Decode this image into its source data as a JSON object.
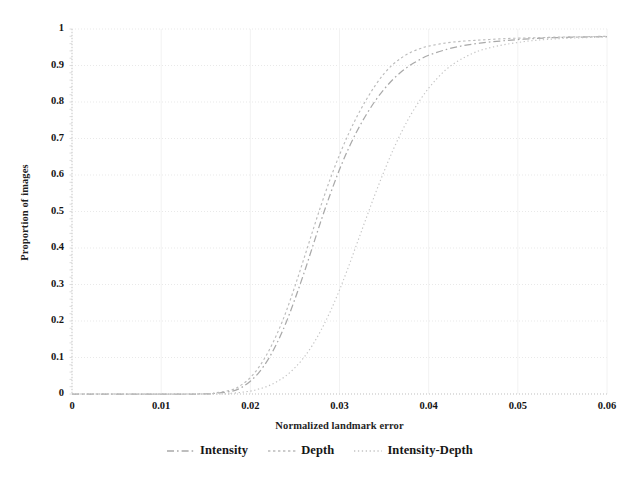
{
  "chart_data": {
    "type": "line",
    "title": "",
    "subtitle": "",
    "xlabel": "Normalized landmark error",
    "ylabel": "Proportion of images",
    "xlim": [
      0,
      0.06
    ],
    "ylim": [
      0,
      1
    ],
    "xticks": [
      "0",
      "0.01",
      "0.02",
      "0.03",
      "0.04",
      "0.05",
      "0.06"
    ],
    "xtick_values": [
      0,
      0.01,
      0.02,
      0.03,
      0.04,
      0.05,
      0.06
    ],
    "yticks": [
      "0",
      "0.1",
      "0.2",
      "0.3",
      "0.4",
      "0.5",
      "0.6",
      "0.7",
      "0.8",
      "0.9",
      "1"
    ],
    "ytick_values": [
      0,
      0.1,
      0.2,
      0.3,
      0.4,
      0.5,
      0.6,
      0.7,
      0.8,
      0.9,
      1
    ],
    "grid": "horizontal-dotted",
    "legend_position": "below",
    "line_color": "#b9b9b9",
    "grid_color": "#e9e9e9",
    "axis_color": "#c9c9c9",
    "series": [
      {
        "name": "Intensity",
        "dash": "dash-dot",
        "color": "#a9a9a9",
        "x": [
          0.0,
          0.014,
          0.016,
          0.018,
          0.019,
          0.02,
          0.021,
          0.022,
          0.023,
          0.024,
          0.025,
          0.026,
          0.027,
          0.028,
          0.029,
          0.03,
          0.031,
          0.032,
          0.033,
          0.034,
          0.035,
          0.036,
          0.037,
          0.038,
          0.039,
          0.04,
          0.042,
          0.044,
          0.046,
          0.048,
          0.05,
          0.052,
          0.055,
          0.06
        ],
        "y": [
          0.0,
          0.0,
          0.002,
          0.008,
          0.018,
          0.035,
          0.06,
          0.095,
          0.14,
          0.195,
          0.26,
          0.33,
          0.405,
          0.48,
          0.55,
          0.615,
          0.672,
          0.722,
          0.765,
          0.803,
          0.835,
          0.862,
          0.884,
          0.902,
          0.916,
          0.928,
          0.944,
          0.955,
          0.962,
          0.967,
          0.971,
          0.974,
          0.977,
          0.979
        ]
      },
      {
        "name": "Depth",
        "dash": "dotted",
        "color": "#bcbcbc",
        "x": [
          0.0,
          0.014,
          0.016,
          0.018,
          0.019,
          0.02,
          0.021,
          0.022,
          0.023,
          0.024,
          0.025,
          0.026,
          0.027,
          0.028,
          0.029,
          0.03,
          0.031,
          0.032,
          0.033,
          0.034,
          0.035,
          0.036,
          0.037,
          0.038,
          0.039,
          0.04,
          0.042,
          0.044,
          0.046,
          0.048,
          0.05,
          0.052,
          0.055,
          0.06
        ],
        "y": [
          0.0,
          0.0,
          0.003,
          0.012,
          0.025,
          0.045,
          0.075,
          0.115,
          0.165,
          0.225,
          0.295,
          0.37,
          0.447,
          0.522,
          0.592,
          0.655,
          0.712,
          0.762,
          0.806,
          0.845,
          0.878,
          0.903,
          0.922,
          0.936,
          0.946,
          0.953,
          0.962,
          0.967,
          0.97,
          0.973,
          0.975,
          0.976,
          0.978,
          0.98
        ]
      },
      {
        "name": "Intensity-Depth",
        "dash": "fine-dotted",
        "color": "#c4c4c4",
        "x": [
          0.0,
          0.016,
          0.018,
          0.02,
          0.021,
          0.022,
          0.023,
          0.024,
          0.025,
          0.026,
          0.027,
          0.028,
          0.029,
          0.03,
          0.031,
          0.032,
          0.033,
          0.034,
          0.035,
          0.036,
          0.037,
          0.038,
          0.039,
          0.04,
          0.041,
          0.042,
          0.043,
          0.044,
          0.045,
          0.046,
          0.048,
          0.05,
          0.052,
          0.055,
          0.06
        ],
        "y": [
          0.0,
          0.0,
          0.002,
          0.008,
          0.014,
          0.022,
          0.034,
          0.05,
          0.072,
          0.1,
          0.135,
          0.178,
          0.228,
          0.285,
          0.348,
          0.415,
          0.482,
          0.548,
          0.61,
          0.668,
          0.72,
          0.765,
          0.804,
          0.838,
          0.866,
          0.89,
          0.908,
          0.922,
          0.934,
          0.943,
          0.955,
          0.963,
          0.969,
          0.974,
          0.978
        ]
      }
    ]
  },
  "legend": {
    "items": [
      {
        "label": "Intensity"
      },
      {
        "label": "Depth"
      },
      {
        "label": "Intensity-Depth"
      }
    ]
  }
}
